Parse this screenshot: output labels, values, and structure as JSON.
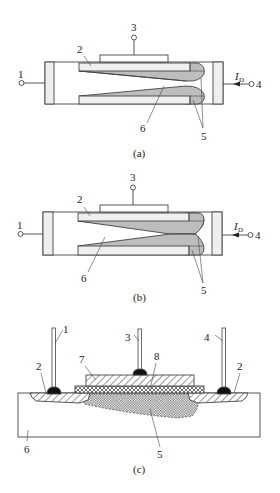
{
  "figure": {
    "colors": {
      "line": "#444444",
      "light_fill": "#efefef",
      "channel_fill": "#bdbdbd",
      "contact_blob": "#111111",
      "background": "#ffffff"
    },
    "panels": [
      {
        "caption": "(a)",
        "description": "MOSFET channel, linear regime (symmetric pinch-off near drain)",
        "labels": {
          "source": "1",
          "oxide": "2",
          "gate": "3",
          "drain": "4",
          "depletion": "5",
          "channel": "6"
        },
        "current_label": "I",
        "current_subscript": "D"
      },
      {
        "caption": "(b)",
        "description": "MOSFET channel at pinch-off (channel tapers to a point at drain)",
        "labels": {
          "source": "1",
          "oxide": "2",
          "gate": "3",
          "drain": "4",
          "depletion": "5",
          "channel": "6"
        },
        "current_label": "I",
        "current_subscript": "D"
      },
      {
        "caption": "(c)",
        "description": "Cross-section of MOS transistor",
        "labels": {
          "source_lead": "1",
          "diffusion_left": "2",
          "diffusion_right": "2",
          "gate_lead": "3",
          "drain_lead": "4",
          "channel_region": "5",
          "substrate": "6",
          "gate_metal": "7",
          "gate_oxide": "8"
        }
      }
    ]
  }
}
